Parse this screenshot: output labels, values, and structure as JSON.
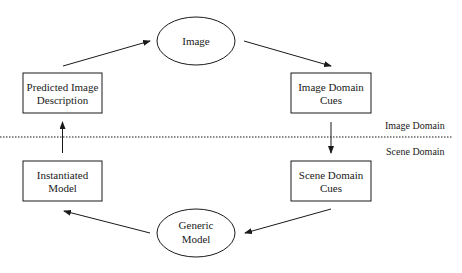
{
  "diagram": {
    "nodes": {
      "image": {
        "shape": "ellipse",
        "label": "Image"
      },
      "predicted_image_description": {
        "shape": "rect",
        "line1": "Predicted Image",
        "line2": "Description"
      },
      "image_domain_cues": {
        "shape": "rect",
        "line1": "Image Domain",
        "line2": "Cues"
      },
      "instantiated_model": {
        "shape": "rect",
        "line1": "Instantiated",
        "line2": "Model"
      },
      "scene_domain_cues": {
        "shape": "rect",
        "line1": "Scene Domain",
        "line2": "Cues"
      },
      "generic_model": {
        "shape": "ellipse",
        "line1": "Generic",
        "line2": "Model"
      }
    },
    "edges": [
      {
        "from": "image",
        "to": "image_domain_cues"
      },
      {
        "from": "image_domain_cues",
        "to": "scene_domain_cues"
      },
      {
        "from": "scene_domain_cues",
        "to": "generic_model"
      },
      {
        "from": "generic_model",
        "to": "instantiated_model"
      },
      {
        "from": "instantiated_model",
        "to": "predicted_image_description"
      },
      {
        "from": "predicted_image_description",
        "to": "image"
      }
    ],
    "divider": {
      "style": "dotted",
      "above_label": "Image Domain",
      "below_label": "Scene Domain"
    },
    "colors": {
      "stroke": "#1a1a1a",
      "background": "#ffffff"
    }
  }
}
